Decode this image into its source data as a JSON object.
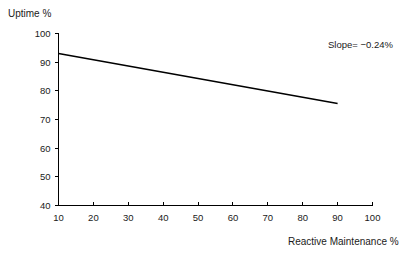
{
  "chart_data": {
    "type": "line",
    "title": "",
    "subtitle": "",
    "xlabel": "Reactive Maintenance %",
    "ylabel": "Uptime %",
    "xlim": [
      10,
      100
    ],
    "ylim": [
      40,
      100
    ],
    "xticks": [
      10,
      20,
      30,
      40,
      50,
      60,
      70,
      80,
      90,
      100
    ],
    "xtick_labels": [
      "10",
      "20",
      "30",
      "40",
      "50",
      "60",
      "70",
      "80",
      "90",
      "100"
    ],
    "yticks": [
      40,
      50,
      60,
      70,
      80,
      90,
      100
    ],
    "ytick_labels": [
      "40",
      "50",
      "60",
      "70",
      "80",
      "90",
      "100"
    ],
    "grid": false,
    "legend": false,
    "legend_position": "none",
    "series": [
      {
        "name": "Uptime trend",
        "color": "#000000",
        "x": [
          10,
          90
        ],
        "values": [
          93.0,
          75.6
        ]
      }
    ],
    "annotations": [
      {
        "name": "slope-label",
        "text": "Slope= −0.24%",
        "x": 93,
        "y": 96.5
      }
    ]
  },
  "axis_titles": {
    "y": "Uptime %",
    "x": "Reactive Maintenance %"
  },
  "colors": {
    "background": "#ffffff",
    "axis": "#000000",
    "line": "#000000",
    "text": "#1a1a1a"
  }
}
